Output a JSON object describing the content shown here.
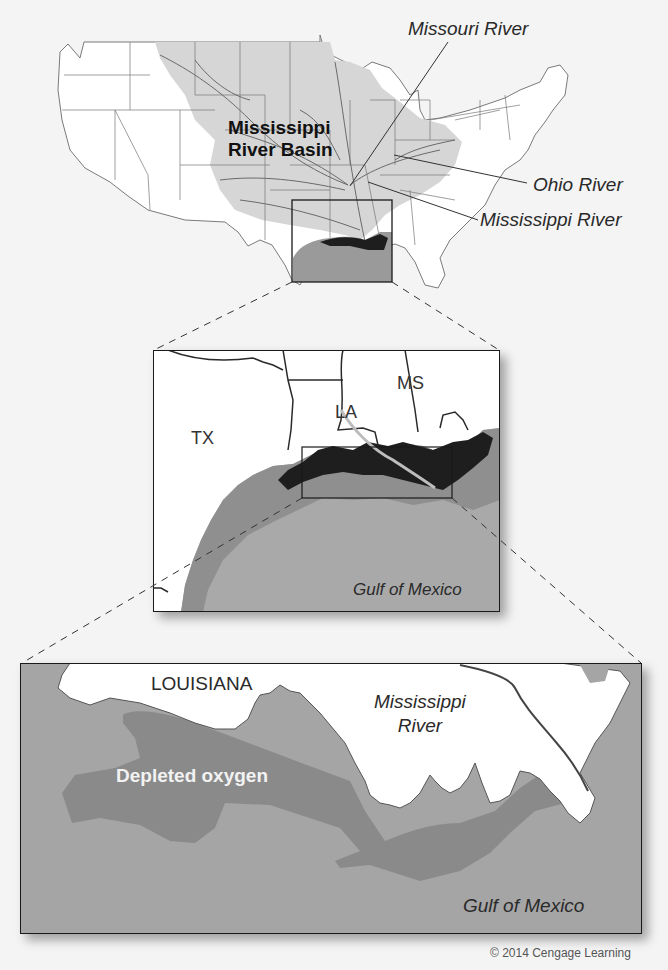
{
  "figure": {
    "copyright": "© 2014 Cengage Learning"
  },
  "colors": {
    "background": "#f4f4f4",
    "land": "#ffffff",
    "basin_fill": "#d6d6d6",
    "state_lines": "#6e6e6e",
    "rivers": "#707070",
    "gulf_middle": "#a9a9a9",
    "gulf_bottom": "#a5a5a5",
    "hypoxia_moderate": "#8f8f8f",
    "hypoxia_severe": "#1e1e1e",
    "depleted_zone": "#8a8a8a",
    "frame": "#1a1a1a"
  },
  "overview_map": {
    "basin_label_line1": "Mississippi",
    "basin_label_line2": "River Basin",
    "callouts": [
      {
        "label": "Missouri River"
      },
      {
        "label": "Ohio River"
      },
      {
        "label": "Mississippi River"
      }
    ]
  },
  "regional_inset": {
    "state_labels": [
      "TX",
      "LA",
      "MS"
    ],
    "water_label": "Gulf of Mexico"
  },
  "detail_inset": {
    "land_label": "LOUISIANA",
    "river_label_line1": "Mississippi",
    "river_label_line2": "River",
    "zone_label": "Depleted oxygen",
    "water_label": "Gulf of Mexico"
  }
}
